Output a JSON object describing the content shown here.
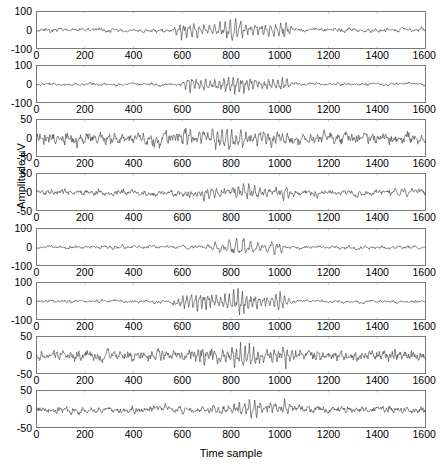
{
  "figure": {
    "type": "multi-panel-time-series",
    "panel_count": 8,
    "xlabel": "Time sample",
    "ylabel": "Amplitude µV",
    "background": "#ffffff",
    "trace_color": "#3c3c3c",
    "axis_color": "#7a7a7a"
  },
  "chart_data": {
    "type": "line",
    "title": "",
    "subtitle": "",
    "xlabel": "Time sample",
    "ylabel": "Amplitude µV",
    "xlim": [
      0,
      1600
    ],
    "xticks": [
      0,
      200,
      400,
      600,
      800,
      1000,
      1200,
      1400,
      1600
    ],
    "xticklabels": [
      "0",
      "200",
      "400",
      "600",
      "800",
      "1000",
      "1200",
      "1400",
      "1600"
    ],
    "grid": false,
    "legend": null,
    "panels": [
      {
        "index": 1,
        "ylim": [
          -100,
          100
        ],
        "yticks": [
          -100,
          0,
          100
        ],
        "yticklabels": [
          "-100",
          "0",
          "100"
        ],
        "burst_start": 620,
        "burst_end": 1010,
        "baseline_amp": 9,
        "burst_amp": 58,
        "seed": 11,
        "base_freq": 0.085,
        "burst_freq": 0.3
      },
      {
        "index": 2,
        "ylim": [
          -100,
          100
        ],
        "yticks": [
          -100,
          0,
          100
        ],
        "yticklabels": [
          "-100",
          "0",
          "100"
        ],
        "burst_start": 650,
        "burst_end": 1000,
        "baseline_amp": 7,
        "burst_amp": 52,
        "seed": 23,
        "base_freq": 0.075,
        "burst_freq": 0.34
      },
      {
        "index": 3,
        "ylim": [
          -50,
          50
        ],
        "yticks": [
          -50,
          0,
          50
        ],
        "yticklabels": [
          "-50",
          "0",
          "50"
        ],
        "burst_start": 640,
        "burst_end": 1020,
        "baseline_amp": 13,
        "burst_amp": 26,
        "seed": 37,
        "base_freq": 0.22,
        "burst_freq": 0.33
      },
      {
        "index": 4,
        "ylim": [
          -50,
          50
        ],
        "yticks": [
          -50,
          0,
          50
        ],
        "yticklabels": [
          "-50",
          "0",
          "50"
        ],
        "burst_start": 740,
        "burst_end": 1010,
        "baseline_amp": 7,
        "burst_amp": 19,
        "seed": 53,
        "base_freq": 0.17,
        "burst_freq": 0.29
      },
      {
        "index": 5,
        "ylim": [
          -100,
          100
        ],
        "yticks": [
          -100,
          0,
          100
        ],
        "yticklabels": [
          "-100",
          "0",
          "100"
        ],
        "burst_start": 760,
        "burst_end": 960,
        "baseline_amp": 8,
        "burst_amp": 55,
        "seed": 67,
        "base_freq": 0.1,
        "burst_freq": 0.22
      },
      {
        "index": 6,
        "ylim": [
          -100,
          100
        ],
        "yticks": [
          -100,
          0,
          100
        ],
        "yticklabels": [
          "-100",
          "0",
          "100"
        ],
        "burst_start": 620,
        "burst_end": 985,
        "baseline_amp": 7,
        "burst_amp": 68,
        "seed": 79,
        "base_freq": 0.09,
        "burst_freq": 0.36
      },
      {
        "index": 7,
        "ylim": [
          -50,
          50
        ],
        "yticks": [
          -50,
          0,
          50
        ],
        "yticklabels": [
          "-50",
          "0",
          "50"
        ],
        "burst_start": 700,
        "burst_end": 1010,
        "baseline_amp": 12,
        "burst_amp": 30,
        "seed": 91,
        "base_freq": 0.21,
        "burst_freq": 0.36
      },
      {
        "index": 8,
        "ylim": [
          -50,
          50
        ],
        "yticks": [
          -50,
          0,
          50
        ],
        "yticklabels": [
          "-50",
          "0",
          "50"
        ],
        "burst_start": 780,
        "burst_end": 1000,
        "baseline_amp": 8,
        "burst_amp": 24,
        "seed": 103,
        "base_freq": 0.19,
        "burst_freq": 0.3
      }
    ]
  }
}
